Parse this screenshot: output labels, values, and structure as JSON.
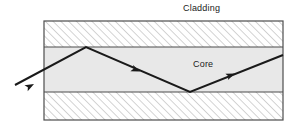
{
  "diagram": {
    "type": "optical-fiber-total-internal-reflection",
    "labels": {
      "cladding": "Cladding",
      "core": "Core"
    },
    "colors": {
      "outline": "#4d4d4d",
      "boundary_line": "#4d4d4d",
      "core_fill": "#e8e8e8",
      "cladding_fill": "#ffffff",
      "hatch_stroke": "#b0b0b0",
      "ray_stroke": "#1a1a1a",
      "label_text": "#1a1a1a",
      "page_background": "#ffffff"
    },
    "geometry": {
      "box": {
        "x": 44,
        "y": 21,
        "width": 239,
        "height": 99
      },
      "core_band": {
        "x": 44,
        "y": 47,
        "width": 239,
        "height": 45
      },
      "cladding_top": {
        "x": 44,
        "y": 21,
        "width": 239,
        "height": 26
      },
      "cladding_bottom": {
        "x": 44,
        "y": 92,
        "width": 239,
        "height": 28
      },
      "hatch_angle_deg": 45,
      "hatch_spacing_px": 5.5,
      "ray_stroke_width": 2
    },
    "ray": {
      "name": "light-ray-path",
      "points": [
        {
          "x": 15,
          "y": 85,
          "role": "entry-outside"
        },
        {
          "x": 86,
          "y": 47,
          "role": "reflection-top-boundary"
        },
        {
          "x": 190,
          "y": 92,
          "role": "reflection-bottom-boundary"
        },
        {
          "x": 283,
          "y": 55,
          "role": "exit-right-edge"
        }
      ],
      "arrowheads": [
        {
          "x": 33,
          "y": 75,
          "angle_deg": -28,
          "segment": "incoming"
        },
        {
          "x": 139,
          "y": 70,
          "angle_deg": 23,
          "segment": "descending"
        },
        {
          "x": 234,
          "y": 74,
          "angle_deg": -22,
          "segment": "ascending"
        }
      ]
    }
  }
}
